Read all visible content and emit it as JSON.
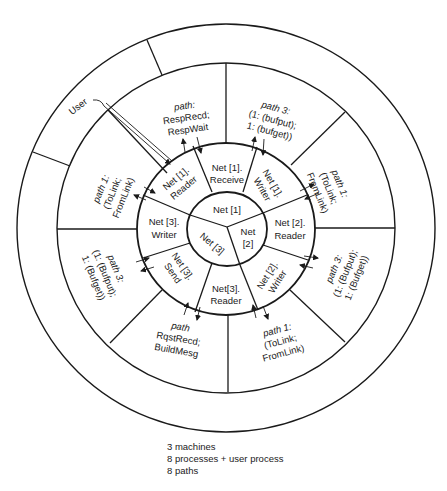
{
  "center": {
    "machines": [
      {
        "id": "net1",
        "label": "Net [1]"
      },
      {
        "id": "net2",
        "line1": "Net",
        "line2": "[2]"
      },
      {
        "id": "net3",
        "label": "Net [3]"
      }
    ]
  },
  "processes": [
    {
      "id": "net1-receive",
      "line1": "Net [1].",
      "line2": "Receive"
    },
    {
      "id": "net1-writer",
      "line1": "Net [1].",
      "line2": "Writer"
    },
    {
      "id": "net2-reader",
      "line1": "Net [2].",
      "line2": "Reader"
    },
    {
      "id": "net2-writer",
      "line1": "Net [2].",
      "line2": "Writer"
    },
    {
      "id": "net3-reader",
      "line1": "Net[3].",
      "line2": "Reader"
    },
    {
      "id": "net3-send",
      "line1": "Net [3].",
      "line2": "Send"
    },
    {
      "id": "net3-writer",
      "line1": "Net [3].",
      "line2": "Writer"
    },
    {
      "id": "net1-reader",
      "line1": "Net [1].",
      "line2": "Reader"
    }
  ],
  "paths": [
    {
      "id": "path-resp",
      "line1": "path:",
      "line2": "RespRecd;",
      "line3": "RespWait"
    },
    {
      "id": "path-top-right",
      "line1": "path 3:",
      "line2": "(1: (bufput);",
      "line3": "1: (bufget))"
    },
    {
      "id": "path-right-upper",
      "line1": "path 1:",
      "line2": "(ToLink;",
      "line3": "FromLink)"
    },
    {
      "id": "path-right-lower",
      "line1": "path 3:",
      "line2": "(1: (Bufput);",
      "line3": "1: (Bufget))"
    },
    {
      "id": "path-bottom-right",
      "line1": "path 1:",
      "line2": "(ToLink;",
      "line3": "FromLink)"
    },
    {
      "id": "path-rqst",
      "line1": "path",
      "line2": "RqstRecd;",
      "line3": "BuildMesg"
    },
    {
      "id": "path-left-lower",
      "line1": "path 3:",
      "line2": "(1: (Bufput);",
      "line3": "1: (Bufget))"
    },
    {
      "id": "path-left-upper",
      "line1": "path 1:",
      "line2": "(ToLink;",
      "line3": "FromLink)"
    }
  ],
  "user": {
    "label": "User"
  },
  "legend": {
    "line1": "3 machines",
    "line2": "8 processes + user process",
    "line3": "8 paths"
  },
  "colors": {
    "ink": "#1a1a1a",
    "background": "#ffffff"
  }
}
